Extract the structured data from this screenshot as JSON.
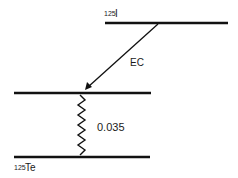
{
  "diagram": {
    "type": "nuclear decay scheme",
    "parent": {
      "mass_number": "125",
      "symbol": "I"
    },
    "daughter": {
      "mass_number": "125",
      "symbol": "Te"
    },
    "transitions": [
      {
        "type": "EC",
        "label": "EC",
        "from": "125I ground level",
        "to": "125Te excited level"
      },
      {
        "type": "gamma",
        "label": "0.035",
        "from": "125Te excited level",
        "to": "125Te ground level"
      }
    ],
    "levels": [
      {
        "name": "125I ground level"
      },
      {
        "name": "125Te excited level"
      },
      {
        "name": "125Te ground level"
      }
    ],
    "colors": {
      "line": "#111111",
      "background": "#ffffff"
    }
  }
}
